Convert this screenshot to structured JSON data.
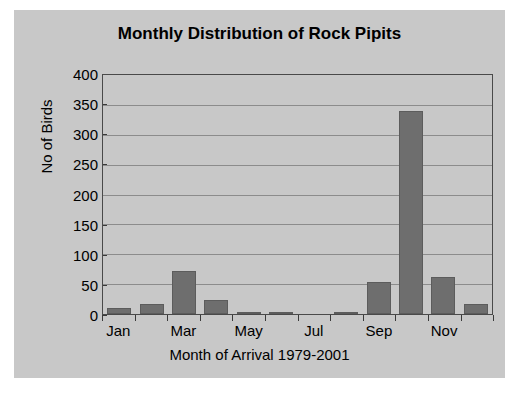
{
  "chart_data": {
    "type": "bar",
    "title": "Monthly Distribution of Rock Pipits",
    "xlabel": "Month of Arrival 1979-2001",
    "ylabel": "No of Birds",
    "categories": [
      "Jan",
      "Feb",
      "Mar",
      "Apr",
      "May",
      "Jun",
      "Jul",
      "Aug",
      "Sep",
      "Oct",
      "Nov",
      "Dec"
    ],
    "visible_tick_labels": [
      "Jan",
      "",
      "Mar",
      "",
      "May",
      "",
      "Jul",
      "",
      "Sep",
      "",
      "Nov",
      ""
    ],
    "values": [
      10,
      16,
      72,
      24,
      4,
      3,
      0,
      3,
      53,
      340,
      62,
      16
    ],
    "ylim": [
      0,
      400
    ],
    "ytick_labels": [
      "400",
      "350",
      "300",
      "250",
      "200",
      "150",
      "100",
      "50",
      "0"
    ],
    "ytick_values": [
      400,
      350,
      300,
      250,
      200,
      150,
      100,
      50,
      0
    ],
    "grid": true,
    "legend": "none",
    "colors": {
      "bar_fill": "#6e6e6e",
      "bar_edge": "#5c5c5c",
      "panel_background": "#c8c8c8",
      "gridline": "#8c8c8c",
      "axis": "#4a4a4a",
      "text": "#000000",
      "page_background": "#ffffff"
    }
  }
}
